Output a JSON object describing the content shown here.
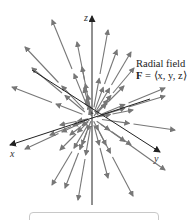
{
  "figure": {
    "title_line1": "Radial field",
    "formula_bold": "F",
    "formula_rest": " = ⟨x, y, z⟩",
    "axes": {
      "x": "x",
      "y": "y",
      "z": "z"
    },
    "colors": {
      "axis": "#222222",
      "arrow": "#777777",
      "box_border": "#c8c8c8"
    },
    "origin": [
      92,
      118
    ],
    "arrows": [
      [
        92,
        118,
        52,
        20
      ],
      [
        92,
        118,
        25,
        47
      ],
      [
        92,
        118,
        32,
        68
      ],
      [
        92,
        118,
        12,
        87
      ],
      [
        92,
        118,
        77,
        42
      ],
      [
        92,
        118,
        82,
        67
      ],
      [
        92,
        118,
        84,
        88
      ],
      [
        92,
        118,
        86,
        100
      ],
      [
        92,
        118,
        108,
        30
      ],
      [
        92,
        118,
        117,
        50
      ],
      [
        92,
        118,
        131,
        52
      ],
      [
        92,
        118,
        134,
        68
      ],
      [
        92,
        118,
        124,
        86
      ],
      [
        92,
        118,
        165,
        88
      ],
      [
        92,
        118,
        165,
        96
      ],
      [
        92,
        118,
        108,
        100
      ],
      [
        92,
        118,
        175,
        130
      ],
      [
        92,
        118,
        133,
        110
      ],
      [
        92,
        118,
        165,
        170
      ],
      [
        92,
        118,
        131,
        145
      ],
      [
        92,
        118,
        133,
        196
      ],
      [
        92,
        118,
        108,
        178
      ],
      [
        92,
        118,
        106,
        145
      ],
      [
        92,
        118,
        78,
        200
      ],
      [
        92,
        118,
        82,
        145
      ],
      [
        92,
        118,
        65,
        188
      ],
      [
        92,
        118,
        52,
        185
      ],
      [
        92,
        118,
        60,
        150
      ],
      [
        92,
        118,
        25,
        149
      ],
      [
        92,
        118,
        50,
        135
      ],
      [
        92,
        118,
        70,
        135
      ],
      [
        92,
        118,
        60,
        125
      ]
    ]
  }
}
